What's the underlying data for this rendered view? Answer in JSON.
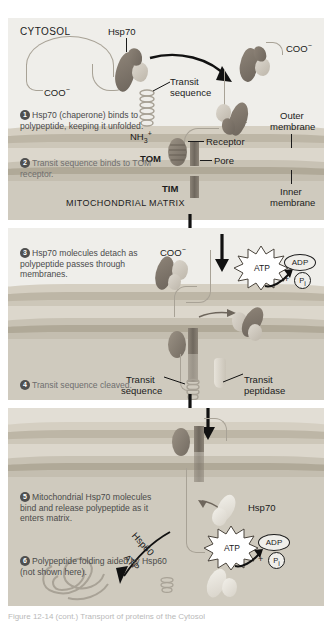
{
  "figure": {
    "title_caption": "Figure 12-14 (cont.) Transport of proteins of the Cytosol"
  },
  "panel1": {
    "compartment_label": "CYTOSOL",
    "hsp70_label": "Hsp70",
    "coo_left": "COO",
    "coo_left_charge": "−",
    "coo_right": "COO",
    "coo_right_charge": "−",
    "transit_sequence": "Transit\nsequence",
    "transit_sequence_line1": "Transit",
    "transit_sequence_line2": "sequence",
    "nh3": "NH",
    "nh3_sub": "3",
    "nh3_sup": "+",
    "receptor": "Receptor",
    "pore": "Pore",
    "tom": "TOM",
    "tim": "TIM",
    "outer_membrane_line1": "Outer",
    "outer_membrane_line2": "membrane",
    "inner_membrane_line1": "Inner",
    "inner_membrane_line2": "membrane",
    "matrix_label": "MITOCHONDRIAL MATRIX",
    "step1_num": "1",
    "step1_text": "Hsp70 (chaperone) binds to polypeptide, keeping it unfolded.",
    "step2_num": "2",
    "step2_text": "Transit sequence binds to TOM receptor."
  },
  "panel2": {
    "step3_num": "3",
    "step3_text": "Hsp70 molecules detach as polypeptide passes through membranes.",
    "step4_num": "4",
    "step4_text": "Transit sequence cleaved.",
    "coo": "COO",
    "coo_charge": "−",
    "atp": "ATP",
    "adp": "ADP",
    "plus": "+",
    "pi": "P",
    "pi_sub": "i",
    "transit_sequence_line1": "Transit",
    "transit_sequence_line2": "sequence",
    "transit_peptidase_line1": "Transit",
    "transit_peptidase_line2": "peptidase"
  },
  "panel3": {
    "step5_num": "5",
    "step5_text": "Mitochondrial Hsp70 molecules bind and release polypeptide as it enters matrix.",
    "step6_num": "6",
    "step6_text": "Polypeptide folding aided by Hsp60 (not shown here).",
    "hsp70": "Hsp70",
    "hsp60": "Hsp60",
    "atp_arrow_label": "ATP",
    "atp": "ATP",
    "adp": "ADP",
    "plus": "+",
    "pi": "P",
    "pi_sub": "i"
  },
  "colors": {
    "panel_bg": "#efeeea",
    "membrane_outer": "#bfb8a8",
    "membrane_inner": "#a9a293",
    "matrix_fill": "#cfcabe",
    "hsp_dark": "#7b7367",
    "hsp_light": "#d4cec4",
    "text": "#1b1b1b",
    "step_text": "#6e6e6e"
  }
}
